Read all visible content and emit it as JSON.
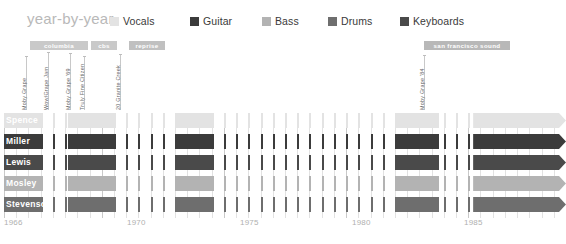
{
  "header": {
    "title": "year-by-year"
  },
  "legend": {
    "items": [
      {
        "label": "Vocals",
        "color": "#e3e3e3",
        "x": 0
      },
      {
        "label": "Guitar",
        "color": "#3b3b3b",
        "x": 80
      },
      {
        "label": "Bass",
        "color": "#b3b3b3",
        "x": 152
      },
      {
        "label": "Drums",
        "color": "#6e6e6e",
        "x": 218
      },
      {
        "label": "Keyboards",
        "color": "#4a4a4a",
        "x": 290
      }
    ]
  },
  "labels": {
    "bars": [
      {
        "name": "columbia",
        "x": 30,
        "width": 58,
        "color": "#c9c9c9"
      },
      {
        "name": "cbs",
        "x": 91,
        "width": 26,
        "color": "#c9c9c9"
      },
      {
        "name": "reprise",
        "x": 129,
        "width": 36,
        "color": "#c0c0c0"
      },
      {
        "name": "san francisco sound",
        "x": 424,
        "width": 86,
        "color": "#b8b8b8"
      }
    ]
  },
  "annotations": [
    {
      "text": "Moby Grape",
      "x": 26,
      "top": 56,
      "height": 54
    },
    {
      "text": "Wow/Grape Jam",
      "x": 48,
      "top": 52,
      "height": 58
    },
    {
      "text": "Moby Grape '69",
      "x": 70,
      "top": 53,
      "height": 57
    },
    {
      "text": "Truly Fine Citizen",
      "x": 84,
      "top": 56,
      "height": 54
    },
    {
      "text": "20 Granite Creek",
      "x": 120,
      "top": 54,
      "height": 56
    },
    {
      "text": "Moby Grape '84",
      "x": 424,
      "top": 55,
      "height": 55
    }
  ],
  "chart_data": {
    "type": "bar",
    "title": "year-by-year",
    "xlabel": "",
    "ylabel": "",
    "xlim": [
      1966,
      1989
    ],
    "grid": true,
    "legend_position": "top",
    "categories": [
      "Spence",
      "Miller",
      "Lewis",
      "Mosley",
      "Stevenson"
    ],
    "series": [
      {
        "name": "Vocals",
        "color": "#e3e3e3"
      },
      {
        "name": "Guitar",
        "color": "#3b3b3b"
      },
      {
        "name": "Bass",
        "color": "#b3b3b3"
      },
      {
        "name": "Drums",
        "color": "#6e6e6e"
      },
      {
        "name": "Keyboards",
        "color": "#4a4a4a"
      }
    ],
    "x_ticks": [
      1966,
      1970,
      1975,
      1980,
      1985
    ],
    "rows": [
      {
        "label": "Spence",
        "role": "Vocals",
        "color": "#e3e3e3",
        "segments": [
          {
            "start": 1966.0,
            "end": 1967.5,
            "arrow": false
          },
          {
            "start": 1968.6,
            "end": 1970.5,
            "arrow": false
          },
          {
            "start": 1973.0,
            "end": 1974.6,
            "arrow": false
          },
          {
            "start": 1982.0,
            "end": 1983.8,
            "arrow": false
          },
          {
            "start": 1985.2,
            "end": 1989.0,
            "arrow": true
          }
        ]
      },
      {
        "label": "Miller",
        "role": "Guitar",
        "color": "#3b3b3b",
        "segments": [
          {
            "start": 1966.0,
            "end": 1967.6,
            "arrow": false
          },
          {
            "start": 1968.6,
            "end": 1970.5,
            "arrow": false
          },
          {
            "start": 1973.0,
            "end": 1974.6,
            "arrow": false
          },
          {
            "start": 1982.0,
            "end": 1983.8,
            "arrow": false
          },
          {
            "start": 1985.2,
            "end": 1989.0,
            "arrow": true
          }
        ]
      },
      {
        "label": "Lewis",
        "role": "Keyboards",
        "color": "#4a4a4a",
        "segments": [
          {
            "start": 1966.0,
            "end": 1967.6,
            "arrow": false
          },
          {
            "start": 1968.6,
            "end": 1970.5,
            "arrow": false
          },
          {
            "start": 1973.0,
            "end": 1974.6,
            "arrow": false
          },
          {
            "start": 1982.0,
            "end": 1983.8,
            "arrow": false
          },
          {
            "start": 1985.2,
            "end": 1989.0,
            "arrow": true
          }
        ]
      },
      {
        "label": "Mosley",
        "role": "Bass",
        "color": "#b3b3b3",
        "segments": [
          {
            "start": 1966.0,
            "end": 1967.6,
            "arrow": false
          },
          {
            "start": 1968.6,
            "end": 1970.5,
            "arrow": false
          },
          {
            "start": 1973.0,
            "end": 1974.6,
            "arrow": false
          },
          {
            "start": 1982.0,
            "end": 1983.8,
            "arrow": false
          },
          {
            "start": 1985.2,
            "end": 1989.0,
            "arrow": true
          }
        ]
      },
      {
        "label": "Stevenson",
        "role": "Drums",
        "color": "#6e6e6e",
        "segments": [
          {
            "start": 1966.0,
            "end": 1967.6,
            "arrow": false
          },
          {
            "start": 1968.6,
            "end": 1970.5,
            "arrow": false
          },
          {
            "start": 1973.0,
            "end": 1974.6,
            "arrow": false
          },
          {
            "start": 1982.0,
            "end": 1983.8,
            "arrow": false
          },
          {
            "start": 1985.2,
            "end": 1989.0,
            "arrow": true
          }
        ]
      }
    ]
  },
  "axis": {
    "years": [
      {
        "label": "1966",
        "x": 4
      },
      {
        "label": "1970",
        "x": 127
      },
      {
        "label": "1975",
        "x": 240
      },
      {
        "label": "1980",
        "x": 352
      },
      {
        "label": "1985",
        "x": 464
      }
    ]
  }
}
